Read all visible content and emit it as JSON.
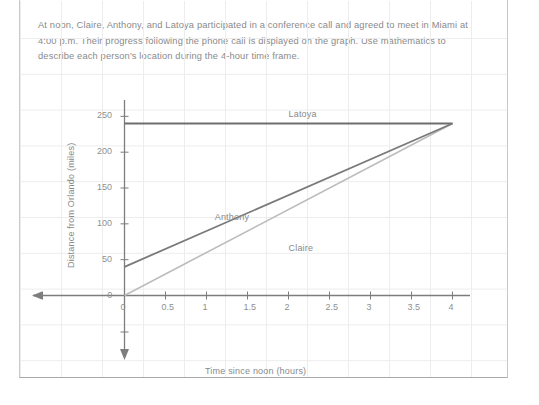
{
  "document": {
    "prompt_text": "At noon, Claire, Anthony, and Latoya participated in a conference call and agreed to meet in Miami at 4:00 p.m. Their progress following the phone call is displayed on the graph. Use mathematics to describe each person's location during the 4-hour time frame."
  },
  "chart_data": {
    "type": "line",
    "title": "",
    "xlabel": "Time since noon (hours)",
    "ylabel": "Distance from Orlando (miles)",
    "xlim": [
      0,
      4
    ],
    "ylim": [
      0,
      250
    ],
    "xticks": [
      "0",
      "0.5",
      "1",
      "1.5",
      "2",
      "2.5",
      "3",
      "3.5",
      "4"
    ],
    "xtick_values": [
      0,
      0.5,
      1,
      1.5,
      2,
      2.5,
      3,
      3.5,
      4
    ],
    "yticks": [
      "0",
      "50",
      "100",
      "150",
      "200",
      "250"
    ],
    "ytick_values": [
      0,
      50,
      100,
      150,
      200,
      250
    ],
    "grid": true,
    "legend": "inline-labels",
    "series": [
      {
        "name": "Latoya",
        "color": "#6e6e6e",
        "x": [
          0,
          4
        ],
        "values": [
          240,
          240
        ],
        "label_x": 2.0,
        "label_y": 252
      },
      {
        "name": "Anthony",
        "color": "#7a7a7a",
        "x": [
          0,
          4
        ],
        "values": [
          40,
          240
        ],
        "label_x": 1.1,
        "label_y": 108
      },
      {
        "name": "Claire",
        "color": "#bcbcbc",
        "x": [
          0,
          4
        ],
        "values": [
          0,
          240
        ],
        "label_x": 2.0,
        "label_y": 65
      }
    ],
    "axis_colors": {
      "axis_line": "#7d7d7d",
      "grid_line": "#ededed",
      "tick_text": "#8f8f8f"
    }
  }
}
